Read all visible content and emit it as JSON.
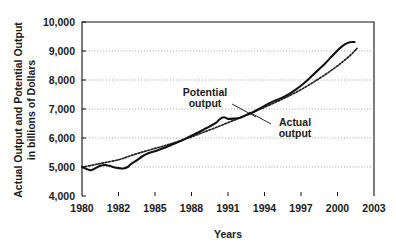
{
  "chart_data": {
    "type": "line",
    "title": "",
    "xlabel": "Years",
    "ylabel_line1": "Actual Output and Potential Output",
    "ylabel_line2": "in billions of Dollars",
    "ylim": [
      4000,
      10000
    ],
    "ytick_values": [
      4000,
      5000,
      6000,
      7000,
      8000,
      9000,
      10000
    ],
    "ytick_labels": [
      "4,000",
      "5,000",
      "6,000",
      "7,000",
      "8,000",
      "9,000",
      "10,000"
    ],
    "xtick_labels": [
      "1980",
      "1982",
      "1985",
      "1988",
      "1991",
      "1994",
      "1997",
      "2000",
      "2003"
    ],
    "xtick_positions": [
      0,
      1,
      2,
      3,
      4,
      5,
      6,
      7,
      8
    ],
    "grid": "horizontal-dotted",
    "legend_position": "inline-annotation",
    "annotations": [
      {
        "key": "potential",
        "label_line1": "Potential",
        "label_line2": "output"
      },
      {
        "key": "actual",
        "label_line1": "Actual",
        "label_line2": "output"
      }
    ],
    "series": [
      {
        "name": "Actual output",
        "style": "solid",
        "color": "#111111",
        "x": [
          1980.0,
          1980.25,
          1980.5,
          1980.75,
          1981.0,
          1981.25,
          1981.5,
          1981.75,
          1982.0,
          1982.25,
          1982.5,
          1982.75,
          1983.0,
          1983.5,
          1984.0,
          1984.5,
          1985.0,
          1985.5,
          1986.0,
          1986.5,
          1987.0,
          1987.5,
          1988.0,
          1988.5,
          1989.0,
          1989.5,
          1990.0,
          1990.25,
          1990.5,
          1990.75,
          1991.0,
          1991.5,
          1992.0,
          1992.5,
          1993.0,
          1993.5,
          1994.0,
          1994.5,
          1995.0,
          1995.5,
          1996.0,
          1996.5,
          1997.0,
          1997.5,
          1998.0,
          1998.5,
          1999.0,
          1999.5,
          2000.0,
          2000.5,
          2001.0,
          2001.4
        ],
        "y": [
          5000,
          4930,
          4890,
          4960,
          5040,
          5070,
          5040,
          4990,
          4960,
          4950,
          4960,
          5000,
          5090,
          5230,
          5380,
          5480,
          5540,
          5620,
          5700,
          5790,
          5880,
          5980,
          6080,
          6180,
          6290,
          6400,
          6520,
          6620,
          6700,
          6710,
          6660,
          6670,
          6700,
          6790,
          6880,
          6990,
          7110,
          7220,
          7310,
          7400,
          7510,
          7650,
          7800,
          7980,
          8180,
          8380,
          8580,
          8800,
          9020,
          9200,
          9300,
          9310
        ]
      },
      {
        "name": "Potential output",
        "style": "dotted",
        "color": "#232323",
        "x": [
          1980.0,
          1981.0,
          1982.0,
          1983.0,
          1984.0,
          1985.0,
          1986.0,
          1987.0,
          1988.0,
          1989.0,
          1990.0,
          1991.0,
          1992.0,
          1993.0,
          1994.0,
          1995.0,
          1996.0,
          1997.0,
          1998.0,
          1999.0,
          2000.0,
          2001.0,
          2001.6
        ],
        "y": [
          4990,
          5120,
          5250,
          5390,
          5520,
          5640,
          5760,
          5890,
          6040,
          6200,
          6360,
          6530,
          6700,
          6880,
          7060,
          7250,
          7450,
          7670,
          7920,
          8190,
          8490,
          8830,
          9090
        ]
      }
    ]
  },
  "figure": {
    "plot_left": 82,
    "plot_right": 374,
    "plot_top": 22,
    "plot_bottom": 196
  }
}
